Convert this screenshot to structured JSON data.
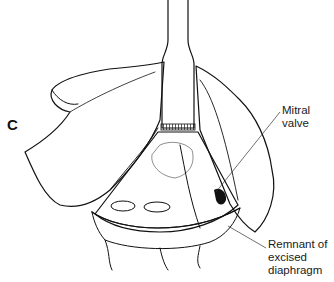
{
  "figure": {
    "panel_letter": "C",
    "labels": [
      {
        "id": "mitral-valve",
        "text": "Mitral valve"
      },
      {
        "id": "remnant",
        "lines": [
          "Remnant of",
          "excised",
          "diaphragm"
        ]
      }
    ],
    "colors": {
      "ink": "#111111",
      "background": "#ffffff"
    }
  }
}
